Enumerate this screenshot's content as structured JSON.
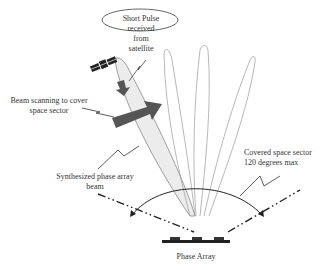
{
  "labels": {
    "short_pulse": [
      "Short Pulse",
      "received",
      "from",
      "satellite"
    ],
    "beam_scanning": [
      "Beam scanning to cover",
      "space sector"
    ],
    "synthesized": [
      "Synthesized phase array",
      "beam"
    ],
    "covered_sector": [
      "Covered space sector",
      "120 degrees max"
    ],
    "phase_array": "Phase Array"
  },
  "icons": {
    "satellite": "satellite-icon",
    "scan_arrow": "thick-arrow-right",
    "down_arrow": "thick-arrow-down"
  },
  "colors": {
    "beam_fill": "#ececec",
    "outline": "#888888",
    "dark": "#333333",
    "arrow": "#555555"
  },
  "sector": {
    "max_degrees": 120
  }
}
